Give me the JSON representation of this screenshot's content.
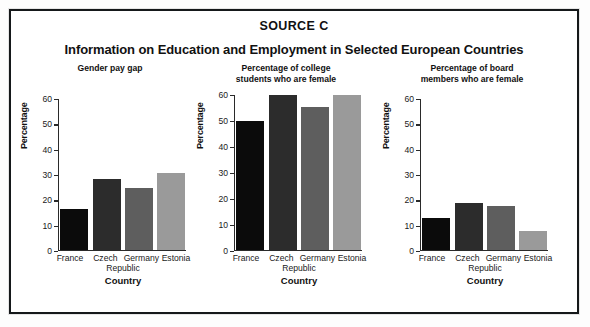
{
  "source_label": "SOURCE C",
  "main_title": "Information on Education and Employment in Selected European Countries",
  "axis": {
    "ylabel": "Percentage",
    "xlabel": "Country",
    "yticks": [
      "60",
      "50",
      "40",
      "30",
      "20",
      "10",
      "0"
    ],
    "xticks_line1": [
      "France",
      "Czech",
      "Germany",
      "Estonia"
    ],
    "xticks_line2": "Republic"
  },
  "colors": {
    "france": "#0b0b0b",
    "czech": "#2c2c2c",
    "germany": "#5e5e5e",
    "estonia": "#9a9a9a",
    "axis": "#2a2a2a",
    "border": "#15181a"
  },
  "chart_data": [
    {
      "type": "bar",
      "title": "Gender pay gap",
      "title_line1": "Gender pay gap",
      "title_line2": "",
      "categories": [
        "France",
        "Czech Republic",
        "Germany",
        "Estonia"
      ],
      "values": [
        16,
        28,
        24.5,
        30.5
      ],
      "xlabel": "Country",
      "ylabel": "Percentage",
      "ylim": [
        0,
        60
      ],
      "yticks": [
        0,
        10,
        20,
        30,
        40,
        50,
        60
      ],
      "grid": false,
      "legend": "none"
    },
    {
      "type": "bar",
      "title": "Percentage of college students who are female",
      "title_line1": "Percentage of college",
      "title_line2": "students who are female",
      "categories": [
        "France",
        "Czech Republic",
        "Germany",
        "Estonia"
      ],
      "values": [
        50,
        60,
        55.5,
        60
      ],
      "xlabel": "Country",
      "ylabel": "Percentage",
      "ylim": [
        0,
        60
      ],
      "yticks": [
        0,
        10,
        20,
        30,
        40,
        50,
        60
      ],
      "grid": false,
      "legend": "none"
    },
    {
      "type": "bar",
      "title": "Percentage of board members who are female",
      "title_line1": "Percentage of board",
      "title_line2": "members who are female",
      "categories": [
        "France",
        "Czech Republic",
        "Germany",
        "Estonia"
      ],
      "values": [
        12.5,
        18.5,
        17.5,
        7.5
      ],
      "xlabel": "Country",
      "ylabel": "Percentage",
      "ylim": [
        0,
        60
      ],
      "yticks": [
        0,
        10,
        20,
        30,
        40,
        50,
        60
      ],
      "grid": false,
      "legend": "none"
    }
  ]
}
